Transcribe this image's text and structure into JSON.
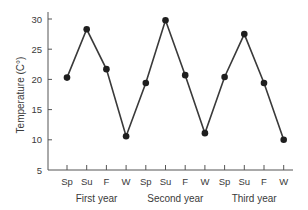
{
  "chart_data": {
    "type": "line",
    "title": "",
    "xlabel": "",
    "ylabel": "Temperature (C°)",
    "ylim": [
      5,
      30
    ],
    "yticks": [
      5,
      10,
      15,
      20,
      25,
      30
    ],
    "grid": false,
    "legend": null,
    "categories": [
      "Sp",
      "Su",
      "F",
      "W",
      "Sp",
      "Su",
      "F",
      "W",
      "Sp",
      "Su",
      "F",
      "W"
    ],
    "groups": [
      {
        "label": "First year",
        "start": 0,
        "end": 3
      },
      {
        "label": "Second year",
        "start": 4,
        "end": 7
      },
      {
        "label": "Third year",
        "start": 8,
        "end": 11
      }
    ],
    "series": [
      {
        "name": "Temperature",
        "values": [
          20.3,
          28.3,
          21.7,
          10.6,
          19.4,
          29.8,
          20.7,
          11.1,
          20.4,
          27.5,
          19.4,
          10.0
        ],
        "marker": "circle",
        "color": "#2a2a2a"
      }
    ]
  },
  "style": {
    "axis_color": "#555555",
    "line_color": "#3a3a3a",
    "marker_color": "#1e1e1e"
  }
}
